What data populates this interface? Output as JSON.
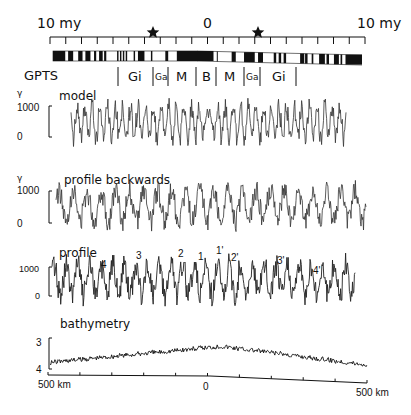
{
  "chart_data": [
    {
      "id": "gpts-scale",
      "type": "timescale",
      "title": "GPTS",
      "axis": {
        "left_label": "10 my",
        "center_label": "0",
        "right_label": "10 my",
        "x_range_my": [
          -10,
          10
        ],
        "tick_count": 21
      },
      "stars_my": [
        -3.4,
        3.4
      ],
      "polarity_blocks_left": [
        [
          0.0,
          0.085
        ],
        [
          0.105,
          0.14
        ],
        [
          0.175,
          0.205
        ],
        [
          0.225,
          0.26
        ],
        [
          0.285,
          0.3
        ],
        [
          0.32,
          0.345
        ],
        [
          0.355,
          0.37
        ],
        [
          0.445,
          0.455
        ],
        [
          0.465,
          0.475
        ],
        [
          0.485,
          0.495
        ],
        [
          0.505,
          0.515
        ],
        [
          0.56,
          0.57
        ],
        [
          0.59,
          0.635
        ],
        [
          0.68,
          0.69
        ],
        [
          0.78,
          0.8
        ],
        [
          0.86,
          1.0
        ]
      ],
      "polarity_blocks_right": [
        [
          0.0,
          0.1
        ],
        [
          0.12,
          0.125
        ],
        [
          0.21,
          0.235
        ],
        [
          0.285,
          0.35
        ],
        [
          0.37,
          0.4
        ],
        [
          0.465,
          0.48
        ],
        [
          0.495,
          0.51
        ],
        [
          0.525,
          0.54
        ],
        [
          0.625,
          0.65
        ],
        [
          0.655,
          0.67
        ],
        [
          0.695,
          0.705
        ],
        [
          0.74,
          0.775
        ],
        [
          0.785,
          0.8
        ],
        [
          0.83,
          0.86
        ],
        [
          0.87,
          0.88
        ],
        [
          0.9,
          1.0
        ]
      ],
      "chron_labels": [
        "Gi",
        "Ga",
        "M",
        "B",
        "M",
        "Ga",
        "Gi"
      ]
    },
    {
      "id": "model",
      "type": "line",
      "title": "model",
      "ylabel": "γ",
      "yticks": [
        "1000",
        "0"
      ],
      "ylim": [
        0,
        1000
      ],
      "symmetric": true
    },
    {
      "id": "profile-backwards",
      "type": "line",
      "title": "profile backwards",
      "ylabel": "γ",
      "yticks": [
        "1000",
        "0"
      ],
      "ylim": [
        0,
        1000
      ]
    },
    {
      "id": "profile",
      "type": "line",
      "title": "profile",
      "yticks": [
        "1000",
        "0"
      ],
      "ylim": [
        0,
        1000
      ],
      "annotations": [
        {
          "label": "4",
          "x_frac": 0.19
        },
        {
          "label": "3",
          "x_frac": 0.295
        },
        {
          "label": "2",
          "x_frac": 0.43
        },
        {
          "label": "1",
          "x_frac": 0.49
        },
        {
          "label": "1'",
          "x_frac": 0.55
        },
        {
          "label": "2'",
          "x_frac": 0.6
        },
        {
          "label": "3'",
          "x_frac": 0.75
        },
        {
          "label": "4'",
          "x_frac": 0.87
        }
      ]
    },
    {
      "id": "bathymetry",
      "type": "line",
      "title": "bathymetry",
      "yticks": [
        "3",
        "4"
      ],
      "ylim": [
        4,
        3
      ],
      "xlabel_left": "500 km",
      "xlabel_center": "0",
      "xlabel_right": "500 km",
      "x_range_km": [
        -500,
        500
      ],
      "tick_count": 11
    }
  ],
  "labels": {
    "top_left": "10 my",
    "top_center": "0",
    "top_right": "10 my",
    "gpts": "GPTS",
    "chrons": [
      "Gi",
      "Ga",
      "M",
      "B",
      "M",
      "Ga",
      "Gi"
    ],
    "gamma": "γ",
    "model": "model",
    "profile_backwards": "profile backwards",
    "profile": "profile",
    "bathymetry": "bathymetry",
    "y1000": "1000",
    "y0": "0",
    "y3": "3",
    "y4": "4",
    "km_left": "500 km",
    "km_center": "0",
    "km_right": "500 km",
    "peaks": [
      "4",
      "3",
      "2",
      "1",
      "1'",
      "2'",
      "3'",
      "4'"
    ]
  }
}
